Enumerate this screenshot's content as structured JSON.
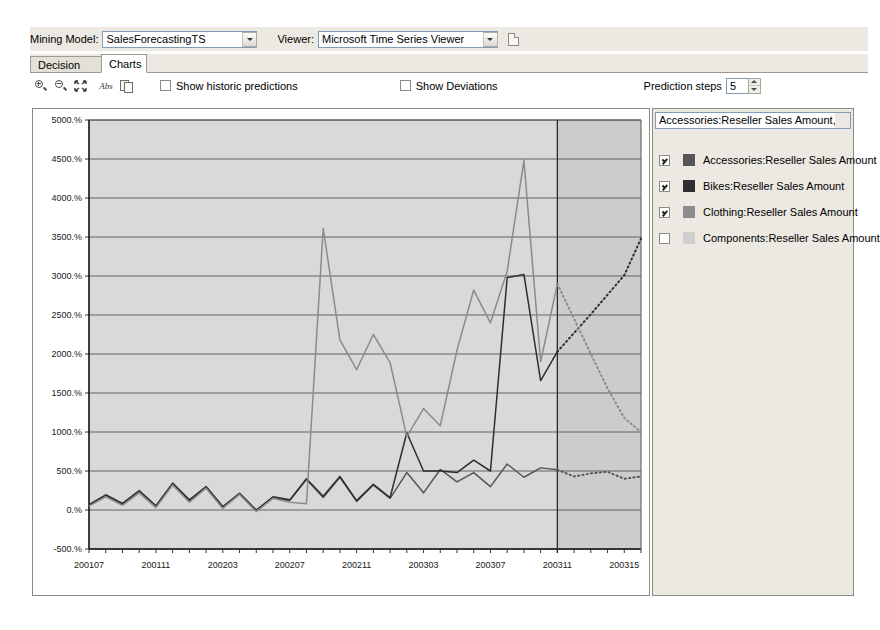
{
  "header": {
    "mining_model_label": "Mining Model:",
    "mining_model_value": "SalesForecastingTS",
    "viewer_label": "Viewer:",
    "viewer_value": "Microsoft Time Series Viewer",
    "refresh_icon": "document-icon"
  },
  "tabs": [
    {
      "label": "Decision Tree",
      "active": false
    },
    {
      "label": "Charts",
      "active": true
    }
  ],
  "toolbar": {
    "zoom_in_icon": "zoom-in-icon",
    "zoom_out_icon": "zoom-out-icon",
    "fit_icon": "fit-to-window-icon",
    "abs_label": "Abs",
    "copy_icon": "copy-icon",
    "show_historic_predictions": {
      "label": "Show historic predictions",
      "checked": false
    },
    "show_deviations": {
      "label": "Show Deviations",
      "checked": false
    },
    "prediction_steps": {
      "label": "Prediction steps",
      "value": "5"
    }
  },
  "legend": {
    "selector_value": "Accessories:Reseller Sales Amount,Bikes:...",
    "items": [
      {
        "label": "Accessories:Reseller Sales Amount",
        "checked": true,
        "color": "#565656"
      },
      {
        "label": "Bikes:Reseller Sales Amount",
        "checked": true,
        "color": "#2e2e2e"
      },
      {
        "label": "Clothing:Reseller Sales Amount",
        "checked": true,
        "color": "#8b8b8b"
      },
      {
        "label": "Components:Reseller Sales Amount",
        "checked": false,
        "color": "#cfcfcf"
      }
    ]
  },
  "chart_data": {
    "type": "line",
    "title": "",
    "xlabel": "",
    "ylabel": "",
    "grid": true,
    "legend_position": "right",
    "plot_background": "#d9d9d9",
    "forecast_background": "#cccccc",
    "gridline_color": "#555555",
    "ylim": [
      -500,
      5000
    ],
    "ytick_step": 500,
    "ytick_labels": [
      "5000.%",
      "4500.%",
      "4000.%",
      "3500.%",
      "3000.%",
      "2500.%",
      "2000.%",
      "1500.%",
      "1000.%",
      "500.%",
      "0.%",
      "-500.%"
    ],
    "xtick_labels": [
      "200107",
      "200111",
      "200203",
      "200207",
      "200211",
      "200303",
      "200307",
      "200311",
      "200315"
    ],
    "x_index_of_ticks": [
      0,
      4,
      8,
      12,
      16,
      20,
      24,
      28,
      32
    ],
    "x_count": 34,
    "forecast_start_index": 28,
    "forecast_boundary_label": "200311",
    "series": [
      {
        "name": "Accessories:Reseller Sales Amount",
        "color": "#565656",
        "historic": [
          60,
          180,
          70,
          230,
          40,
          330,
          110,
          290,
          30,
          210,
          -10,
          160,
          120,
          390,
          160,
          420,
          110,
          320,
          150,
          480,
          220,
          520,
          360,
          480,
          300,
          590,
          420,
          540,
          515
        ],
        "forecast": [
          515,
          430,
          470,
          490,
          400,
          430
        ]
      },
      {
        "name": "Bikes:Reseller Sales Amount",
        "color": "#2e2e2e",
        "historic": [
          70,
          195,
          85,
          250,
          55,
          345,
          130,
          300,
          45,
          215,
          0,
          170,
          130,
          400,
          175,
          430,
          120,
          330,
          160,
          990,
          500,
          500,
          480,
          640,
          500,
          2980,
          3020,
          1660,
          2030
        ],
        "forecast": [
          2030,
          2270,
          2510,
          2760,
          3010,
          3480
        ]
      },
      {
        "name": "Clothing:Reseller Sales Amount",
        "color": "#8b8b8b",
        "historic": [
          50,
          170,
          60,
          220,
          30,
          320,
          100,
          280,
          20,
          200,
          -20,
          150,
          100,
          80,
          3610,
          2180,
          1800,
          2250,
          1890,
          940,
          1300,
          1080,
          2050,
          2820,
          2400,
          3060,
          4480,
          1900,
          2900
        ],
        "forecast": [
          2900,
          2450,
          2000,
          1560,
          1180,
          1000
        ]
      }
    ]
  }
}
